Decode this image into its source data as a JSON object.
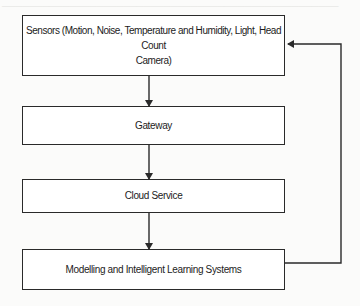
{
  "diagram": {
    "type": "flowchart",
    "background_color": "#fbfbfa",
    "line_color": "#2a2a2a",
    "nodes": [
      {
        "id": "sensors",
        "label": "Sensors (Motion, Noise, Temperature and Humidity, Light, Head Count Camera)",
        "line1": "Sensors (Motion, Noise, Temperature and Humidity, Light, Head Count",
        "line2": "Camera)"
      },
      {
        "id": "gateway",
        "label": "Gateway"
      },
      {
        "id": "cloud",
        "label": "Cloud Service"
      },
      {
        "id": "modelling",
        "label": "Modelling and Intelligent Learning Systems"
      }
    ],
    "edges": [
      {
        "from": "sensors",
        "to": "gateway",
        "style": "arrow"
      },
      {
        "from": "gateway",
        "to": "cloud",
        "style": "arrow"
      },
      {
        "from": "cloud",
        "to": "modelling",
        "style": "arrow"
      },
      {
        "from": "modelling",
        "to": "sensors",
        "style": "feedback-loop-arrow",
        "route": "right side"
      }
    ]
  }
}
